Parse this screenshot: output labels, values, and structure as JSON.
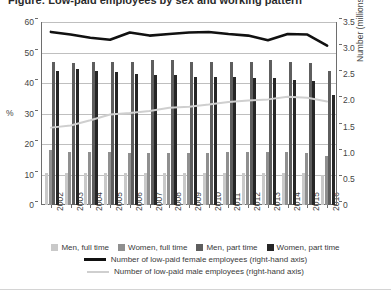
{
  "title": "Figure: Low-paid employees by sex and working pattern",
  "axis": {
    "left_label": "%",
    "left_ticks": [
      "0",
      "10",
      "20",
      "30",
      "40",
      "50",
      "60"
    ],
    "right_label": "Number (millions)",
    "right_ticks": [
      "0",
      "0.5",
      "1.0",
      "1.5",
      "2.0",
      "2.5",
      "3.0",
      "3.5"
    ]
  },
  "legend": {
    "bars": [
      {
        "label": "Men, full time",
        "color": "#c9c9c9"
      },
      {
        "label": "Women, full time",
        "color": "#8f8f8f"
      },
      {
        "label": "Men, part time",
        "color": "#5e5e5e"
      },
      {
        "label": "Women, part time",
        "color": "#262626"
      }
    ],
    "lines": [
      {
        "label": "Number of low-paid female employees (right-hand axis)",
        "color": "#111111"
      },
      {
        "label": "Number of low-paid male employees (right-hand axis)",
        "color": "#cfcfcf"
      }
    ]
  },
  "chart_data": {
    "type": "bar",
    "title": "Figure: Low-paid employees by sex and working pattern",
    "xlabel": "",
    "ylabel": "%",
    "y2label": "Number (millions)",
    "ylim": [
      0,
      60
    ],
    "y2lim": [
      0,
      3.5
    ],
    "grid": true,
    "legend_position": "bottom",
    "categories": [
      "2002",
      "2003",
      "2004",
      "2005",
      "2006",
      "2007",
      "2008",
      "2009",
      "2010",
      "2011",
      "2012",
      "2013",
      "2014",
      "2015",
      "2016"
    ],
    "series": [
      {
        "name": "Men, full time",
        "axis": "left",
        "type": "bar",
        "color": "#c9c9c9",
        "values": [
          10.5,
          10.5,
          10.5,
          10.5,
          10.5,
          10.5,
          10.5,
          10.5,
          10.5,
          10.5,
          10.5,
          10.5,
          10.5,
          10.5,
          10.0
        ]
      },
      {
        "name": "Women, full time",
        "axis": "left",
        "type": "bar",
        "color": "#8f8f8f",
        "values": [
          18.0,
          17.5,
          17.5,
          17.5,
          17.0,
          17.0,
          17.0,
          17.0,
          17.0,
          17.5,
          17.5,
          17.5,
          17.5,
          17.0,
          16.0
        ]
      },
      {
        "name": "Men, part time",
        "axis": "left",
        "type": "bar",
        "color": "#5e5e5e",
        "values": [
          47.0,
          46.5,
          47.0,
          47.0,
          47.0,
          47.5,
          47.5,
          47.0,
          47.0,
          47.0,
          47.0,
          47.5,
          47.0,
          46.5,
          44.0
        ]
      },
      {
        "name": "Women, part time",
        "axis": "left",
        "type": "bar",
        "color": "#262626",
        "values": [
          44.0,
          44.5,
          44.0,
          43.5,
          43.0,
          42.5,
          42.5,
          42.0,
          42.0,
          42.0,
          41.5,
          41.5,
          41.0,
          40.5,
          36.0
        ]
      },
      {
        "name": "Number of low-paid female employees (right-hand axis)",
        "axis": "right",
        "type": "line",
        "color": "#111111",
        "values": [
          3.31,
          3.26,
          3.2,
          3.16,
          3.3,
          3.24,
          3.27,
          3.3,
          3.31,
          3.27,
          3.24,
          3.15,
          3.27,
          3.26,
          3.05
        ]
      },
      {
        "name": "Number of low-paid male employees (right-hand axis)",
        "axis": "right",
        "type": "line",
        "color": "#cfcfcf",
        "values": [
          1.48,
          1.52,
          1.62,
          1.73,
          1.76,
          1.8,
          1.86,
          1.88,
          1.92,
          1.97,
          2.0,
          2.02,
          2.07,
          2.05,
          1.98
        ]
      }
    ]
  }
}
